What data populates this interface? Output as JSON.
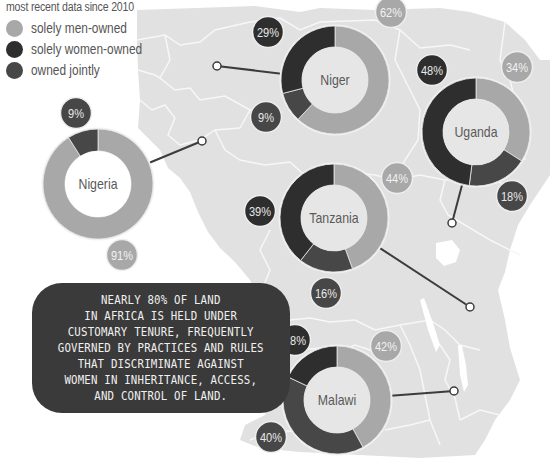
{
  "legend": {
    "title": "most recent data since 2010",
    "items": [
      {
        "label": "solely men-owned",
        "color": "#a8a8a8"
      },
      {
        "label": "solely women-owned",
        "color": "#2e2e2e"
      },
      {
        "label": "owned jointly",
        "color": "#474747"
      }
    ]
  },
  "callout": {
    "text": "Nearly 80% of land in Africa is held under customary tenure, frequently governed by practices and rules that discriminate against women in inheritance, access, and control of land.",
    "lines": [
      "Nearly 80% of land",
      "in Africa is held under",
      "customary tenure, frequently",
      "governed by practices and rules",
      "that discriminate against",
      "women in inheritance, access,",
      "and control of land."
    ]
  },
  "colors": {
    "men": "#a8a8a8",
    "women": "#2e2e2e",
    "joint": "#474747",
    "map": "#e1e1e1",
    "map_border": "#f7f7f7",
    "inner": "#e6e6e6",
    "connector": "#3c3c3c"
  },
  "chart_data": {
    "type": "pie",
    "subtype": "donut",
    "categories": [
      "solely men-owned",
      "solely women-owned",
      "owned jointly"
    ],
    "series": [
      {
        "name": "Niger",
        "values": {
          "solely men-owned": 62,
          "solely women-owned": 29,
          "owned jointly": 9
        }
      },
      {
        "name": "Uganda",
        "values": {
          "solely men-owned": 34,
          "solely women-owned": 48,
          "owned jointly": 18
        }
      },
      {
        "name": "Nigeria",
        "values": {
          "solely men-owned": 91,
          "solely women-owned": 0,
          "owned jointly": 9
        }
      },
      {
        "name": "Tanzania",
        "values": {
          "solely men-owned": 44,
          "solely women-owned": 39,
          "owned jointly": 16
        }
      },
      {
        "name": "Malawi",
        "values": {
          "solely men-owned": 42,
          "solely women-owned": 18,
          "owned jointly": 40
        }
      }
    ],
    "legend_position": "top-left",
    "annotation": "Nearly 80% of land in Africa is held under customary tenure, frequently governed by practices and rules that discriminate against women in inheritance, access, and control of land."
  },
  "donuts": [
    {
      "name": "Niger",
      "cx": 335,
      "cy": 80,
      "R": 54,
      "r": 33,
      "inner": "#e6e6e6",
      "segments": [
        {
          "key": "men",
          "pct": 62
        },
        {
          "key": "joint",
          "pct": 9
        },
        {
          "key": "women",
          "pct": 29
        }
      ],
      "labels": [
        {
          "text": "62%",
          "key": "men",
          "x": 391,
          "y": 12
        },
        {
          "text": "9%",
          "key": "joint",
          "x": 266,
          "y": 117
        },
        {
          "text": "29%",
          "key": "women",
          "x": 268,
          "y": 32
        }
      ],
      "pin": {
        "x": 217,
        "y": 66
      }
    },
    {
      "name": "Uganda",
      "cx": 476,
      "cy": 132,
      "R": 54,
      "r": 33,
      "inner": "#e6e6e6",
      "segments": [
        {
          "key": "men",
          "pct": 34
        },
        {
          "key": "joint",
          "pct": 18
        },
        {
          "key": "women",
          "pct": 48
        }
      ],
      "labels": [
        {
          "text": "34%",
          "key": "men",
          "x": 517,
          "y": 67
        },
        {
          "text": "18%",
          "key": "joint",
          "x": 512,
          "y": 196
        },
        {
          "text": "48%",
          "key": "women",
          "x": 432,
          "y": 70
        }
      ],
      "pin": {
        "x": 452,
        "y": 223
      }
    },
    {
      "name": "Nigeria",
      "cx": 98,
      "cy": 184,
      "R": 55,
      "r": 33,
      "inner": "#ffffff",
      "segments": [
        {
          "key": "men",
          "pct": 91
        },
        {
          "key": "joint",
          "pct": 9
        }
      ],
      "labels": [
        {
          "text": "9%",
          "key": "joint",
          "x": 76,
          "y": 113
        },
        {
          "text": "91%",
          "key": "men",
          "x": 122,
          "y": 255
        }
      ],
      "pin": {
        "x": 202,
        "y": 141
      }
    },
    {
      "name": "Tanzania",
      "cx": 334,
      "cy": 218,
      "R": 54,
      "r": 33,
      "inner": "#e6e6e6",
      "segments": [
        {
          "key": "men",
          "pct": 44
        },
        {
          "key": "joint",
          "pct": 16
        },
        {
          "key": "women",
          "pct": 39
        }
      ],
      "labels": [
        {
          "text": "44%",
          "key": "men",
          "x": 397,
          "y": 178
        },
        {
          "text": "39%",
          "key": "women",
          "x": 260,
          "y": 211
        },
        {
          "text": "16%",
          "key": "joint",
          "x": 326,
          "y": 293
        }
      ],
      "pin": {
        "x": 470,
        "y": 307
      }
    },
    {
      "name": "Malawi",
      "cx": 337,
      "cy": 400,
      "R": 54,
      "r": 33,
      "inner": "#e6e6e6",
      "segments": [
        {
          "key": "men",
          "pct": 42
        },
        {
          "key": "joint",
          "pct": 40
        },
        {
          "key": "women",
          "pct": 18
        }
      ],
      "labels": [
        {
          "text": "42%",
          "key": "men",
          "x": 386,
          "y": 346
        },
        {
          "text": "40%",
          "key": "joint",
          "x": 271,
          "y": 437
        },
        {
          "text": "18%",
          "key": "women",
          "x": 295,
          "y": 340
        }
      ],
      "pin": {
        "x": 454,
        "y": 391
      }
    }
  ]
}
